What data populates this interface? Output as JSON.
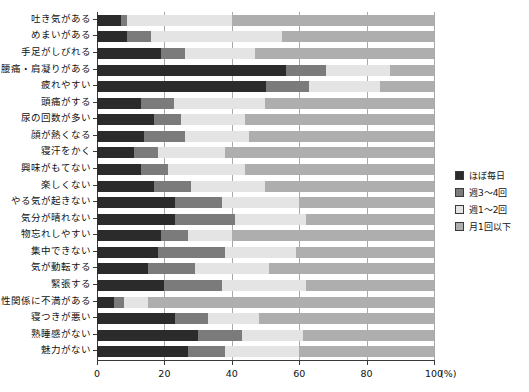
{
  "chart_data": {
    "type": "bar",
    "orientation": "horizontal",
    "stacked": true,
    "stacked_mode": "percent",
    "title": "",
    "xlabel": "(%)",
    "ylabel": "",
    "xlim": [
      0,
      100
    ],
    "xticks": [
      0,
      20,
      40,
      60,
      80,
      100
    ],
    "xticklabels": [
      "0",
      "20",
      "40",
      "60",
      "80",
      "100"
    ],
    "grid": true,
    "grid_axis": "x",
    "legend_position": "right",
    "legend": [
      "ほぼ毎日",
      "週3～4回",
      "週1～2回",
      "月1回以下"
    ],
    "colors": [
      "#2b2b2b",
      "#7b7b7b",
      "#e4e4e4",
      "#aeaeae"
    ],
    "categories": [
      "吐き気がある",
      "めまいがある",
      "手足がしびれる",
      "腰痛・肩凝りがある",
      "疲れやすい",
      "頭痛がする",
      "尿の回数が多い",
      "顔が熱くなる",
      "寝汗をかく",
      "興味がもてない",
      "楽しくない",
      "やる気が起きない",
      "気分が晴れない",
      "物忘れしやすい",
      "集中できない",
      "気が動転する",
      "緊張する",
      "性関係に不満がある",
      "寝つきが悪い",
      "熟睡感がない",
      "魅力がない"
    ],
    "series": [
      {
        "name": "ほぼ毎日",
        "values": [
          7,
          9,
          19,
          56,
          50,
          13,
          17,
          14,
          11,
          13,
          17,
          23,
          23,
          19,
          18,
          15,
          20,
          5,
          23,
          30,
          27
        ]
      },
      {
        "name": "週3～4回",
        "values": [
          2,
          7,
          7,
          12,
          13,
          10,
          8,
          12,
          7,
          8,
          11,
          14,
          18,
          8,
          20,
          14,
          17,
          3,
          10,
          13,
          11
        ]
      },
      {
        "name": "週1～2回",
        "values": [
          31,
          39,
          21,
          19,
          21,
          27,
          19,
          19,
          20,
          23,
          22,
          23,
          21,
          13,
          21,
          22,
          25,
          7,
          15,
          18,
          22
        ]
      },
      {
        "name": "月1回以下",
        "values": [
          60,
          45,
          53,
          13,
          16,
          50,
          56,
          55,
          62,
          56,
          50,
          40,
          38,
          60,
          41,
          49,
          38,
          85,
          52,
          39,
          40
        ]
      }
    ]
  }
}
